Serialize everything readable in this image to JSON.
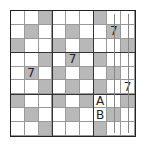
{
  "puzzle": {
    "size": 9,
    "colors": {
      "shaded": "#b8b8b8",
      "grid": "#999999",
      "box_border": "#333333",
      "text": "#222222"
    },
    "shaded_cells": [
      [
        0,
        2
      ],
      [
        0,
        6
      ],
      [
        1,
        1
      ],
      [
        1,
        4
      ],
      [
        1,
        7
      ],
      [
        2,
        0
      ],
      [
        2,
        3
      ],
      [
        2,
        5
      ],
      [
        2,
        8
      ],
      [
        3,
        2
      ],
      [
        3,
        4
      ],
      [
        3,
        6
      ],
      [
        4,
        1
      ],
      [
        4,
        3
      ],
      [
        4,
        5
      ],
      [
        4,
        7
      ],
      [
        5,
        2
      ],
      [
        5,
        4
      ],
      [
        5,
        6
      ],
      [
        6,
        0
      ],
      [
        6,
        3
      ],
      [
        6,
        5
      ],
      [
        6,
        8
      ],
      [
        7,
        1
      ],
      [
        7,
        4
      ],
      [
        7,
        7
      ],
      [
        8,
        2
      ],
      [
        8,
        6
      ]
    ],
    "givens": [
      {
        "row": 1,
        "col": 7,
        "value": "7"
      },
      {
        "row": 3,
        "col": 4,
        "value": "7"
      },
      {
        "row": 4,
        "col": 1,
        "value": "7"
      },
      {
        "row": 5,
        "col": 8,
        "value": "7"
      },
      {
        "row": 6,
        "col": 6,
        "value": "A"
      },
      {
        "row": 7,
        "col": 6,
        "value": "B"
      }
    ],
    "column_markers": [
      {
        "col": 7,
        "label": "vertical-line-marker"
      },
      {
        "col": 8,
        "label": "vertical-line-marker"
      }
    ]
  }
}
